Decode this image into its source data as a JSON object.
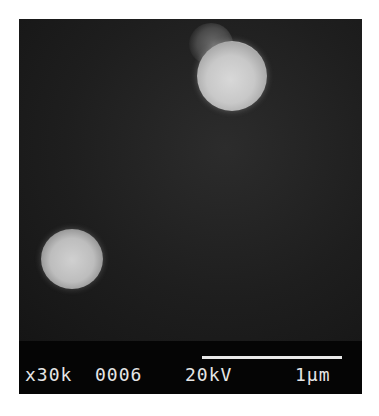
{
  "image": {
    "type": "SEM micrograph",
    "particles": [
      {
        "position": "upper-right",
        "shape": "sphere with small protrusion at upper-left"
      },
      {
        "position": "lower-left",
        "shape": "sphere"
      }
    ]
  },
  "databar": {
    "magnification": "x30k",
    "image_number": "0006",
    "voltage": "20kV",
    "scale_label": "1μm"
  }
}
